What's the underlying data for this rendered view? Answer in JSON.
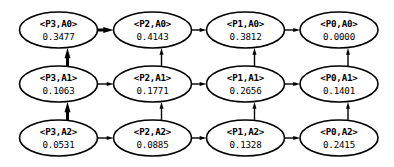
{
  "diagram": {
    "background_color": "#ffffff",
    "stroke_color": "#000000",
    "node_fill": "#ffffff",
    "columns": [
      "P3",
      "P2",
      "P1",
      "P0"
    ],
    "rows": [
      "A0",
      "A1",
      "A2"
    ],
    "nodes": [
      {
        "id": "P3-A0",
        "label": "<P3,A0>",
        "value": "0.3477",
        "col": 0,
        "row": 0
      },
      {
        "id": "P2-A0",
        "label": "<P2,A0>",
        "value": "0.4143",
        "col": 1,
        "row": 0
      },
      {
        "id": "P1-A0",
        "label": "<P1,A0>",
        "value": "0.3812",
        "col": 2,
        "row": 0
      },
      {
        "id": "P0-A0",
        "label": "<P0,A0>",
        "value": "0.0000",
        "col": 3,
        "row": 0
      },
      {
        "id": "P3-A1",
        "label": "<P3,A1>",
        "value": "0.1063",
        "col": 0,
        "row": 1
      },
      {
        "id": "P2-A1",
        "label": "<P2,A1>",
        "value": "0.1771",
        "col": 1,
        "row": 1
      },
      {
        "id": "P1-A1",
        "label": "<P1,A1>",
        "value": "0.2656",
        "col": 2,
        "row": 1
      },
      {
        "id": "P0-A1",
        "label": "<P0,A1>",
        "value": "0.1401",
        "col": 3,
        "row": 1
      },
      {
        "id": "P3-A2",
        "label": "<P3,A2>",
        "value": "0.0531",
        "col": 0,
        "row": 2
      },
      {
        "id": "P2-A2",
        "label": "<P2,A2>",
        "value": "0.0885",
        "col": 1,
        "row": 2
      },
      {
        "id": "P1-A2",
        "label": "<P1,A2>",
        "value": "0.1328",
        "col": 2,
        "row": 2
      },
      {
        "id": "P0-A2",
        "label": "<P0,A2>",
        "value": "0.2415",
        "col": 3,
        "row": 2
      }
    ],
    "edges": [
      {
        "from": "P3-A0",
        "to": "P2-A0",
        "direction": "right",
        "emphasis": "bold"
      },
      {
        "from": "P2-A0",
        "to": "P1-A0",
        "direction": "right",
        "emphasis": "normal"
      },
      {
        "from": "P1-A0",
        "to": "P0-A0",
        "direction": "right",
        "emphasis": "normal"
      },
      {
        "from": "P3-A1",
        "to": "P2-A1",
        "direction": "right",
        "emphasis": "normal"
      },
      {
        "from": "P2-A1",
        "to": "P1-A1",
        "direction": "right",
        "emphasis": "normal"
      },
      {
        "from": "P1-A1",
        "to": "P0-A1",
        "direction": "right",
        "emphasis": "normal"
      },
      {
        "from": "P3-A2",
        "to": "P2-A2",
        "direction": "right",
        "emphasis": "normal"
      },
      {
        "from": "P2-A2",
        "to": "P1-A2",
        "direction": "right",
        "emphasis": "normal"
      },
      {
        "from": "P1-A2",
        "to": "P0-A2",
        "direction": "right",
        "emphasis": "normal"
      },
      {
        "from": "P3-A1",
        "to": "P3-A0",
        "direction": "up",
        "emphasis": "bold"
      },
      {
        "from": "P3-A2",
        "to": "P3-A1",
        "direction": "up",
        "emphasis": "bold"
      },
      {
        "from": "P2-A1",
        "to": "P2-A0",
        "direction": "up",
        "emphasis": "normal"
      },
      {
        "from": "P2-A2",
        "to": "P2-A1",
        "direction": "up",
        "emphasis": "normal"
      },
      {
        "from": "P1-A1",
        "to": "P1-A0",
        "direction": "up",
        "emphasis": "normal"
      },
      {
        "from": "P1-A2",
        "to": "P1-A1",
        "direction": "up",
        "emphasis": "normal"
      },
      {
        "from": "P0-A1",
        "to": "P0-A0",
        "direction": "up",
        "emphasis": "normal"
      },
      {
        "from": "P0-A2",
        "to": "P0-A1",
        "direction": "up",
        "emphasis": "normal"
      }
    ]
  },
  "layout": {
    "col_centers": [
      58.5,
      152.5,
      245.5,
      339.0
    ],
    "row_centers": [
      30.0,
      84.0,
      138.0
    ],
    "ellipse_rx": 39.0,
    "ellipse_ry": 18.0,
    "label_dy": -3.0,
    "value_dy": 9.5,
    "stroke_normal": 1.4,
    "stroke_bold": 3.0,
    "head_normal": 4.0,
    "head_bold": 6.0
  }
}
